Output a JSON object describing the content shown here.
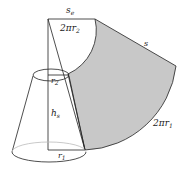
{
  "diagram": {
    "type": "frustum-lateral-surface-development",
    "labels": {
      "se": {
        "base": "s",
        "sub": "e"
      },
      "arc_top": {
        "prefix": "2π",
        "base": "r",
        "sub": "2"
      },
      "s": "s",
      "arc_bottom": {
        "prefix": "2π",
        "base": "r",
        "sub": "1"
      },
      "r2": {
        "base": "r",
        "sub": "2"
      },
      "hs": {
        "base": "h",
        "sub": "s"
      },
      "r1": {
        "base": "r",
        "sub": "1"
      }
    },
    "colors": {
      "stroke": "#222222",
      "sector_fill": "#c8c8c8",
      "hidden_edge": "#bbbbbb",
      "background": "#ffffff"
    }
  }
}
